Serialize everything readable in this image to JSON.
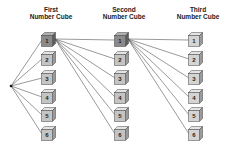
{
  "diagram": {
    "type": "tree-diagram",
    "columns": [
      {
        "label_line1": "First",
        "label_line2": "Number Cube",
        "outcomes": [
          "1",
          "2",
          "3",
          "4",
          "5",
          "6"
        ],
        "highlighted": "1"
      },
      {
        "label_line1": "Second",
        "label_line2": "Number Cube",
        "outcomes": [
          "1",
          "2",
          "3",
          "4",
          "5",
          "6"
        ],
        "highlighted": "1"
      },
      {
        "label_line1": "Third",
        "label_line2": "Number Cube",
        "outcomes": [
          "1",
          "2",
          "3",
          "4",
          "5",
          "6"
        ],
        "highlighted": null
      }
    ],
    "colors": {
      "highlight_face": "#8a8a8a",
      "normal_face": "#c4c4c4",
      "third_face": "#d4d4d4",
      "line": "#555555"
    }
  }
}
